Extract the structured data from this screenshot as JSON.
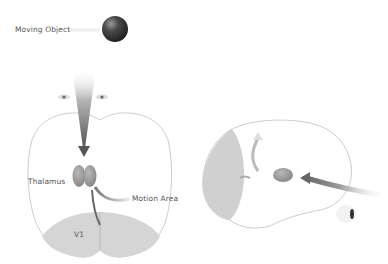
{
  "labels": {
    "moving_object": "Moving Object",
    "thalamus": "Thalamus",
    "motion_area": "Motion Area",
    "v1": "V1"
  },
  "colors": {
    "thalamus": "#9a9a9a",
    "v1_region": "#d4d4d4",
    "ball": "#3a3a3a",
    "brain_outline": "#bdbdbd",
    "arrow": "#6a6a6a"
  }
}
